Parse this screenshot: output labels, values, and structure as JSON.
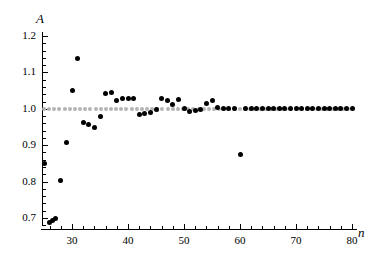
{
  "chart_data": {
    "type": "scatter",
    "title": "",
    "subtitle": "",
    "xlabel": "n",
    "ylabel": "A",
    "xlim": [
      24,
      81
    ],
    "ylim": [
      0.675,
      1.205
    ],
    "grid": false,
    "legend": "none",
    "x_ticks": [
      30,
      40,
      50,
      60,
      70,
      80
    ],
    "x_tick_labels": [
      "30",
      "40",
      "50",
      "60",
      "70",
      "80"
    ],
    "x_minor_tick_step": 2,
    "y_ticks": [
      0.7,
      0.8,
      0.9,
      1.0,
      1.1,
      1.2
    ],
    "y_tick_labels": [
      "0.7",
      "0.8",
      "0.9",
      "1.0",
      "1.1",
      "1.2"
    ],
    "y_minor_tick_step": 0.02,
    "point_color": "#000000",
    "reference_color": "#b3b3b3",
    "reference_line": {
      "label": "A = 1.0",
      "value": 1.0,
      "style": "dotted",
      "x_start": 25,
      "x_end": 80
    },
    "series": [
      {
        "name": "A(n)",
        "marker": "filled-circle",
        "color": "#000000",
        "x": [
          25,
          26,
          26.5,
          27,
          28,
          29,
          30,
          31,
          32,
          33,
          34,
          35,
          36,
          37,
          38,
          39,
          40,
          41,
          42,
          43,
          44,
          45,
          46,
          47,
          48,
          49,
          50,
          51,
          52,
          53,
          54,
          55,
          56,
          57,
          58,
          59,
          60,
          61,
          62,
          63,
          64,
          65,
          66,
          67,
          68,
          69,
          70,
          71,
          72,
          73,
          74,
          75,
          76,
          77,
          78,
          79,
          80
        ],
        "y": [
          0.851,
          0.688,
          0.694,
          0.7,
          0.804,
          0.908,
          1.051,
          1.137,
          0.963,
          0.958,
          0.949,
          0.978,
          1.043,
          1.046,
          1.022,
          1.027,
          1.029,
          1.029,
          0.983,
          0.987,
          0.99,
          0.999,
          1.029,
          1.023,
          1.013,
          1.025,
          1.001,
          0.993,
          0.996,
          0.998,
          1.014,
          1.022,
          1.003,
          1.001,
          1.001,
          1.002,
          0.874,
          1.0,
          1.001,
          1.0,
          1.0,
          1.0,
          1.0,
          1.0,
          1.0,
          1.0,
          1.0,
          1.0,
          1.0,
          1.0,
          1.0,
          1.0,
          1.0,
          1.0,
          1.0,
          1.0,
          1.0
        ]
      }
    ]
  }
}
